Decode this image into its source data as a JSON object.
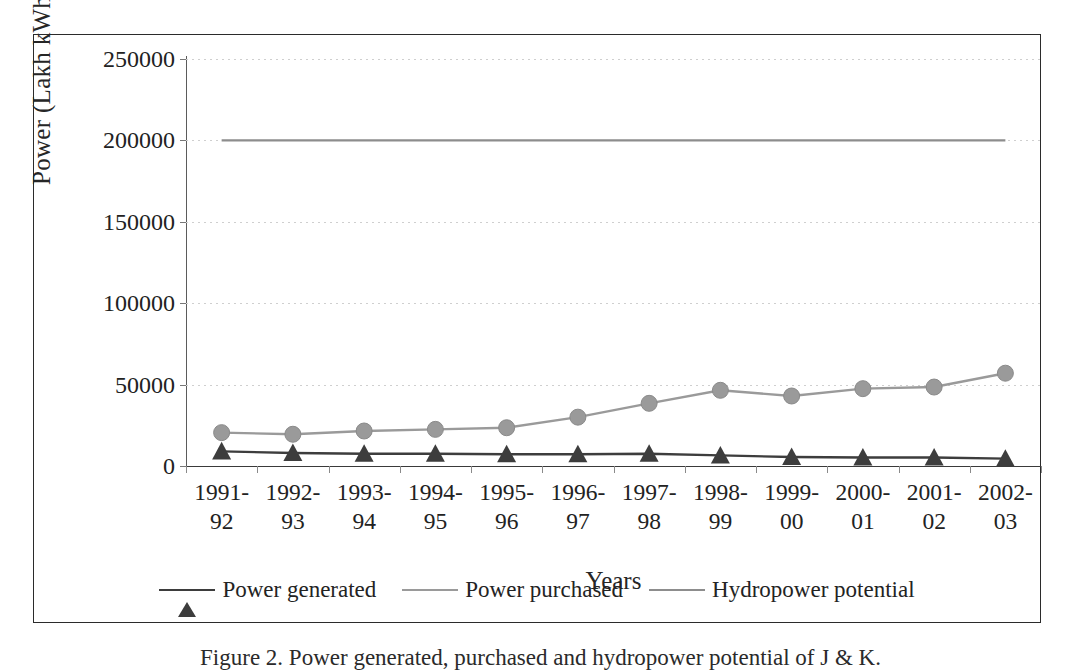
{
  "figure": {
    "caption": "Figure 2.  Power generated, purchased and hydropower potential of J & K."
  },
  "chart_data": {
    "type": "line",
    "title": "",
    "xlabel": "Years",
    "ylabel": "Power (Lakh kWhs)",
    "ylim": [
      0,
      250000
    ],
    "ytick_values": [
      0,
      50000,
      100000,
      150000,
      200000,
      250000
    ],
    "ytick_labels": [
      "0",
      "50000",
      "100000",
      "150000",
      "200000",
      "250000"
    ],
    "grid": true,
    "legend_position": "bottom",
    "categories": [
      "1991-\n92",
      "1992-\n93",
      "1993-\n94",
      "1994-\n95",
      "1995-\n96",
      "1996-\n97",
      "1997-\n98",
      "1998-\n99",
      "1999-\n00",
      "2000-\n01",
      "2001-\n02",
      "2002-\n03"
    ],
    "category_lines": [
      [
        "1991-",
        "92"
      ],
      [
        "1992-",
        "93"
      ],
      [
        "1993-",
        "94"
      ],
      [
        "1994-",
        "95"
      ],
      [
        "1995-",
        "96"
      ],
      [
        "1996-",
        "97"
      ],
      [
        "1997-",
        "98"
      ],
      [
        "1998-",
        "99"
      ],
      [
        "1999-",
        "00"
      ],
      [
        "2000-",
        "01"
      ],
      [
        "2001-",
        "02"
      ],
      [
        "2002-",
        "03"
      ]
    ],
    "series": [
      {
        "name": "Power generated",
        "marker": "triangle",
        "color": "#3d3d3d",
        "values": [
          9000,
          8000,
          7500,
          7500,
          7200,
          7200,
          7500,
          6500,
          5500,
          5200,
          5200,
          4500
        ]
      },
      {
        "name": "Power purchased",
        "marker": "circle",
        "color": "#9a9a9a",
        "values": [
          20500,
          19500,
          21500,
          22500,
          23500,
          30000,
          38500,
          46500,
          43000,
          47500,
          48500,
          57000
        ]
      },
      {
        "name": "Hydropower potential",
        "marker": "none",
        "color": "#8d8d8d",
        "values": [
          200000,
          200000,
          200000,
          200000,
          200000,
          200000,
          200000,
          200000,
          200000,
          200000,
          200000,
          200000
        ]
      }
    ]
  }
}
